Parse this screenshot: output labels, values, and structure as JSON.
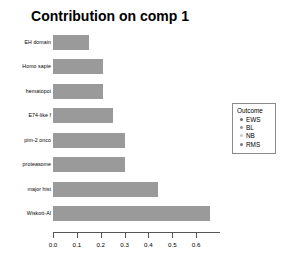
{
  "chart_data": {
    "type": "bar",
    "orientation": "horizontal",
    "title": "Contribution on comp 1",
    "xlabel": "",
    "ylabel": "",
    "xlim": [
      0.0,
      0.7
    ],
    "grid": false,
    "categories": [
      "EH domain",
      "Homo sapie",
      "hematopoi",
      "E74-like f",
      "pim-2 onco",
      "proteasome",
      "major hist",
      "Wiskott-Al"
    ],
    "values": [
      0.15,
      0.21,
      0.21,
      0.25,
      0.3,
      0.3,
      0.44,
      0.66
    ],
    "bar_color": "#9a9a9a",
    "xticks": [
      0.0,
      0.1,
      0.2,
      0.3,
      0.4,
      0.5,
      0.6
    ],
    "xticklabels": [
      "0.0",
      "0.1",
      "0.2",
      "0.3",
      "0.4",
      "0.5",
      "0.6"
    ],
    "legend": {
      "position": "right",
      "title": "Outcome",
      "entries": [
        {
          "label": "EWS",
          "color": "#6d6d6d"
        },
        {
          "label": "BL",
          "color": "#8f8f8f"
        },
        {
          "label": "NB",
          "color": "#c8c8c8"
        },
        {
          "label": "RMS",
          "color": "#7a7a7a"
        }
      ]
    }
  }
}
